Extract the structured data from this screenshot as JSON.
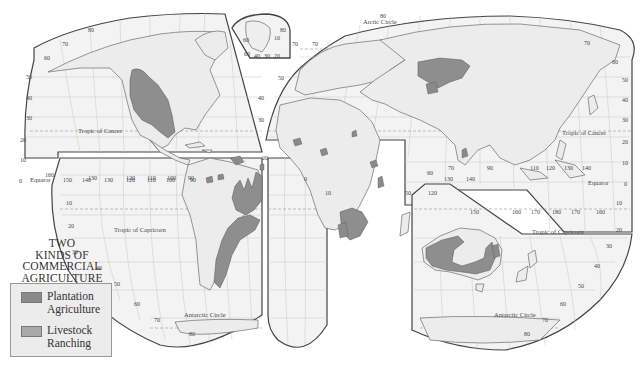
{
  "map": {
    "title_lines": [
      "TWO",
      "KINDS OF",
      "COMMERCIAL",
      "AGRICULTURE"
    ],
    "projection": "interrupted homolosine (Goode)",
    "colors": {
      "ocean": "#f2f2f2",
      "land": "#eeeeee",
      "plantation": "#8a8a8a",
      "ranching": "#a9a9a9",
      "grid": "#c4c4c4",
      "border": "#555555",
      "outline": "#444444"
    },
    "legend": {
      "items": [
        {
          "label_line1": "Plantation",
          "label_line2": "Agriculture",
          "color": "#8a8a8a"
        },
        {
          "label_line1": "Livestock",
          "label_line2": "Ranching",
          "color": "#a9a9a9"
        }
      ]
    },
    "reference_lines": {
      "arctic_circle": "Arctic Circle",
      "tropic_cancer_west": "Tropic of Cancer",
      "tropic_cancer_east": "Tropic of Cancer",
      "equator_west": "Equator",
      "equator_east": "Equator",
      "tropic_capricorn_west": "Tropic of Capricorn",
      "tropic_capricorn_east": "Tropic of Capricorn",
      "antarctic_circle_west": "Antarctic Circle",
      "antarctic_circle_east": "Antarctic Circle"
    },
    "latitude_labels": {
      "west_north": [
        "80",
        "70",
        "60",
        "50",
        "40",
        "30",
        "20",
        "10",
        "0"
      ],
      "west_south": [
        "10",
        "20",
        "30",
        "40",
        "50",
        "60",
        "70",
        "80"
      ],
      "east_north": [
        "80",
        "70",
        "60",
        "50",
        "40",
        "30",
        "20",
        "10",
        "0"
      ],
      "east_south": [
        "10",
        "20",
        "30",
        "40",
        "50",
        "60",
        "70",
        "80"
      ],
      "europe_edge": [
        "70",
        "50",
        "40",
        "30",
        "20"
      ]
    },
    "longitude_labels": {
      "pacific_west": [
        "160",
        "150",
        "140",
        "130",
        "120",
        "110",
        "100",
        "90"
      ],
      "south_america": [
        "130",
        "120",
        "110",
        "100",
        "90"
      ],
      "africa": [
        "0",
        "10",
        "50"
      ],
      "south_asia": [
        "60",
        "70",
        "90",
        "110",
        "120",
        "130",
        "140"
      ],
      "australia_top": [
        "130",
        "140",
        "120"
      ],
      "pacific_east_south": [
        "150",
        "160",
        "170",
        "180",
        "170",
        "160"
      ]
    },
    "greenland_inset": {
      "labels": [
        "80",
        "60",
        "10",
        "70",
        "60",
        "40",
        "30",
        "20"
      ]
    }
  }
}
